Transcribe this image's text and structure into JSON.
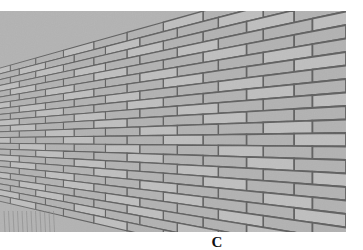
{
  "figure": {
    "image": {
      "subject": "brick-wall-perspective",
      "tone": "grayscale",
      "colors": {
        "brick": "#b8b8b8",
        "brick_light": "#c6c6c6",
        "mortar": "#5e5e5e",
        "background": "#ffffff"
      }
    },
    "caption": "C"
  }
}
